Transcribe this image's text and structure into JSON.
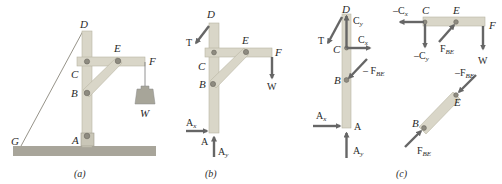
{
  "figure": {
    "panels": [
      {
        "id": "a",
        "caption": "(a)",
        "description": "Frame ACD with member CF and two-force member BE, supported by pin at A and cable DG, carrying weight W at F",
        "points": {
          "D": "D",
          "E": "E",
          "F": "F",
          "C": "C",
          "B": "B",
          "A": "A",
          "G": "G",
          "W": "W"
        }
      },
      {
        "id": "b",
        "caption": "(b)",
        "description": "Free-body diagram of entire frame",
        "points": {
          "D": "D",
          "E": "E",
          "F": "F",
          "C": "C",
          "B": "B",
          "A": "A"
        },
        "forces": {
          "T": "T",
          "W": "W",
          "Ax": "A",
          "Ax_sub": "x",
          "Ay": "A",
          "Ay_sub": "y"
        }
      },
      {
        "id": "c",
        "caption": "(c)",
        "description": "Free-body diagrams of individual members",
        "member_ACD": {
          "points": {
            "D": "D",
            "C": "C",
            "B": "B",
            "A": "A"
          },
          "forces": {
            "T": "T",
            "Cy": "C",
            "Cy_sub": "y",
            "Cx": "C",
            "Cx_sub": "x",
            "FBE": "– F",
            "FBE_sub": "BE",
            "Ax": "A",
            "Ax_sub": "x",
            "Ay": "A",
            "Ay_sub": "y"
          }
        },
        "member_CF": {
          "points": {
            "C": "C",
            "E": "E",
            "F": "F"
          },
          "forces": {
            "negCx": "–C",
            "negCx_sub": "x",
            "negCy": "–C",
            "negCy_sub": "y",
            "FBE": "F",
            "FBE_sub": "BE",
            "W": "W"
          }
        },
        "member_BE": {
          "points": {
            "B": "B",
            "E": "E"
          },
          "forces": {
            "negFBE": "–F",
            "negFBE_sub": "BE",
            "FBE": "F",
            "FBE_sub": "BE"
          }
        }
      }
    ],
    "colors": {
      "wood": "#d9d6c8",
      "arrow": "#666666",
      "ground": "#a8a59a",
      "pin": "#8e8b80"
    }
  }
}
